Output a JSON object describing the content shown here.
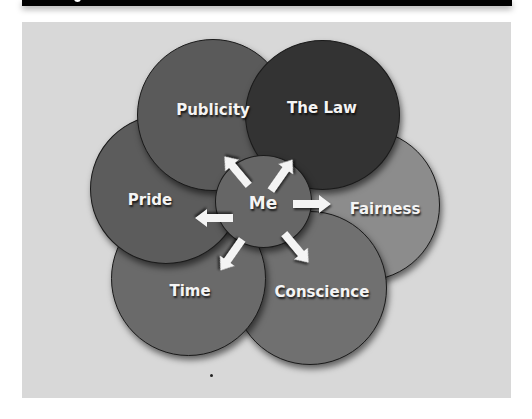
{
  "diagram": {
    "center": {
      "label": "Me",
      "color": "#666666"
    },
    "nodes": [
      {
        "id": "fairness",
        "label": "Fairness",
        "color": "#8c8c8c"
      },
      {
        "id": "conscience",
        "label": "Conscience",
        "color": "#707070"
      },
      {
        "id": "time",
        "label": "Time",
        "color": "#6a6a6a"
      },
      {
        "id": "pride",
        "label": "Pride",
        "color": "#5c5c5c"
      },
      {
        "id": "publicity",
        "label": "Publicity",
        "color": "#5a5a5a"
      },
      {
        "id": "the-law",
        "label": "The Law",
        "color": "#333333"
      }
    ],
    "background_color": "#d8d8d8"
  }
}
